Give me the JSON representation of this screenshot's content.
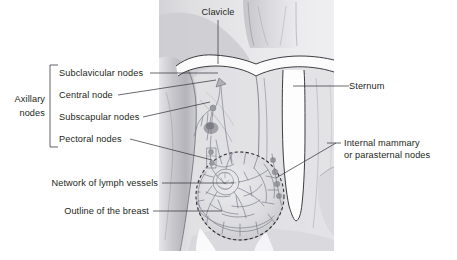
{
  "figure": {
    "background_color": "#ffffff",
    "text_color": "#231f20",
    "leader_color": "#3a3a42",
    "vessel_color": "#7c7f8c",
    "photo_tint": "#d9d9dc"
  },
  "labels": {
    "clavicle": "Clavicle",
    "sternum": "Sternum",
    "internal_mammary_line1": "Internal mammary",
    "internal_mammary_line2": "or parasternal nodes",
    "axillary_line1": "Axillary",
    "axillary_line2": "nodes",
    "subclavicular": "Subclavicular nodes",
    "central": "Central node",
    "subscapular": "Subscapular nodes",
    "pectoral": "Pectoral nodes",
    "network": "Network of lymph vessels",
    "outline": "Outline of the breast"
  }
}
